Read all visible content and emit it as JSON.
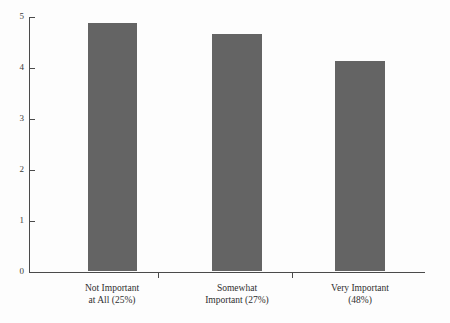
{
  "chart_data": {
    "type": "bar",
    "title": "",
    "xlabel": "",
    "ylabel": "",
    "ylim": [
      0,
      5
    ],
    "ytick_labels": [
      "0",
      "1",
      "2",
      "3",
      "4",
      "5"
    ],
    "ytick_values": [
      0,
      1,
      2,
      3,
      4,
      5
    ],
    "grid": false,
    "legend": false,
    "bar_color": "#646464",
    "categories": [
      "Not Important\nat All (25%)",
      "Somewhat\nImportant (27%)",
      "Very Important\n(48%)"
    ],
    "category_lines": [
      [
        "Not Important",
        "at All (25%)"
      ],
      [
        "Somewhat",
        "Important (27%)"
      ],
      [
        "Very Important",
        "(48%)"
      ]
    ],
    "values": [
      4.86,
      4.65,
      4.12
    ]
  },
  "figure": {
    "background_color": "#fdfdfd",
    "axis_color": "#4a4a4a",
    "text_color": "#2f2f2f"
  }
}
